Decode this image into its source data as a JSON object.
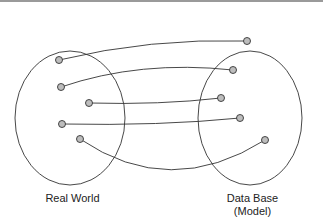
{
  "labels": {
    "left": "Real World",
    "right_line1": "Data Base",
    "right_line2": "(Model)"
  },
  "colors": {
    "stroke": "#333333",
    "node_fill": "#bdbdbd",
    "top_bar": "#9a9a9a"
  },
  "diagram": {
    "left_set": {
      "name": "Real World",
      "nodes": 5
    },
    "right_set": {
      "name": "Data Base (Model)",
      "nodes": 5
    },
    "mappings": [
      {
        "from": 1,
        "to": 1
      },
      {
        "from": 2,
        "to": 2
      },
      {
        "from": 3,
        "to": 3
      },
      {
        "from": 4,
        "to": 4
      },
      {
        "from": 5,
        "to": 5
      }
    ]
  }
}
